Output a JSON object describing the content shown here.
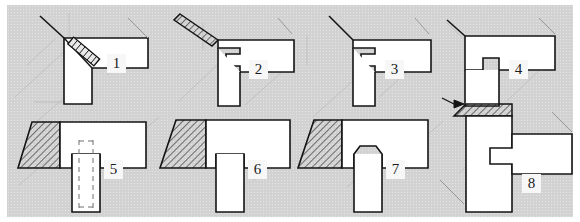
{
  "figure": {
    "type": "axonometric construction details",
    "panel_count": 8,
    "background_color": "#d2d2d2",
    "line_color": "#141414",
    "face_color": "#ffffff",
    "paper_color": "#ffffff"
  },
  "panels": [
    {
      "number": "1",
      "caption_label": "1",
      "detail": "corner joint with diagonal dowel fastener",
      "features": [
        "mitred corner post",
        "horizontal beam",
        "diagonal screw",
        "plain butt face"
      ],
      "has_hatching": false,
      "has_hidden_lines": false,
      "has_fastener": true
    },
    {
      "number": "2",
      "caption_label": "2",
      "detail": "rebated corner joint with hatched edge strip",
      "features": [
        "stepped rebate",
        "hatched top strip",
        "vertical post"
      ],
      "has_hatching": true,
      "has_hidden_lines": false,
      "has_fastener": false
    },
    {
      "number": "3",
      "caption_label": "3",
      "detail": "rebated corner joint, plain edge",
      "features": [
        "stepped rebate",
        "vertical post",
        "horizontal beam"
      ],
      "has_hatching": false,
      "has_hidden_lines": false,
      "has_fastener": false
    },
    {
      "number": "4",
      "caption_label": "4",
      "detail": "tongued corner joint with central tenon",
      "features": [
        "central tongue",
        "shouldered beam",
        "vertical post"
      ],
      "has_hatching": false,
      "has_hidden_lines": false,
      "has_fastener": false
    },
    {
      "number": "5",
      "caption_label": "5",
      "detail": "tee joint with concealed dowel",
      "features": [
        "hatched wedge end",
        "horizontal beam",
        "vertical post",
        "dashed hidden dowel"
      ],
      "has_hatching": true,
      "has_hidden_lines": true,
      "has_fastener": true
    },
    {
      "number": "6",
      "caption_label": "6",
      "detail": "plain tee butt joint",
      "features": [
        "hatched wedge end",
        "horizontal beam",
        "square vertical post"
      ],
      "has_hatching": true,
      "has_hidden_lines": false,
      "has_fastener": false
    },
    {
      "number": "7",
      "caption_label": "7",
      "detail": "tee joint with tapered dovetail tenon",
      "features": [
        "hatched wedge end",
        "dovetail tenon",
        "vertical post"
      ],
      "has_hatching": true,
      "has_hidden_lines": false,
      "has_fastener": false
    },
    {
      "number": "8",
      "caption_label": "8",
      "detail": "column to beam housed joint with wedge shim",
      "features": [
        "vertical column",
        "housed beam notch",
        "hatched wedge shim",
        "leader arrow"
      ],
      "has_hatching": true,
      "has_hidden_lines": false,
      "has_fastener": false
    }
  ]
}
